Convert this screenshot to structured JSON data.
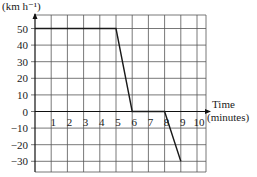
{
  "chart_data": {
    "type": "line",
    "title": "",
    "ylabel": "(km h⁻¹)",
    "xlabel": "Time (minutes)",
    "xlabel_lines": [
      "Time",
      "(minutes)"
    ],
    "x_ticks": [
      1,
      2,
      3,
      4,
      5,
      6,
      7,
      8,
      9,
      10
    ],
    "y_ticks": [
      50,
      40,
      30,
      20,
      10,
      0,
      -10,
      -20,
      -30
    ],
    "xlim": [
      0,
      10.5
    ],
    "ylim": [
      -37,
      58
    ],
    "grid": true,
    "legend": "none",
    "series": [
      {
        "name": "velocity",
        "x": [
          0,
          5,
          6,
          8,
          9
        ],
        "y": [
          50,
          50,
          0,
          0,
          -30
        ]
      }
    ]
  }
}
